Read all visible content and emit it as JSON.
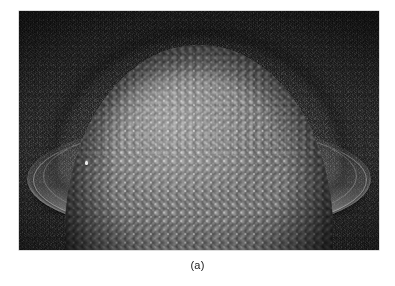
{
  "figure": {
    "caption": "(a)",
    "panel_label": "(a)",
    "image": {
      "alt_description": "Scanning electron micrograph of a dome-shaped microlens structure covered by a close-packed hexagonal monolayer of microspheres, resting on a textured substrate with a bright elliptical basal flange",
      "subject": "microsphere-coated dome",
      "modality": "electron micrograph",
      "color_mode": "grayscale"
    },
    "colors": {
      "page_background": "#ffffff",
      "substrate_dark": "#2c2c2c",
      "dome_midtone": "#8f8f8f",
      "dome_highlight": "#b8b8b8",
      "rim_bright": "#e0e0e0",
      "caption_text": "#1a1a1a"
    },
    "geometry": {
      "photo_left": 19,
      "photo_top": 11,
      "photo_width": 360,
      "photo_height": 239
    }
  }
}
